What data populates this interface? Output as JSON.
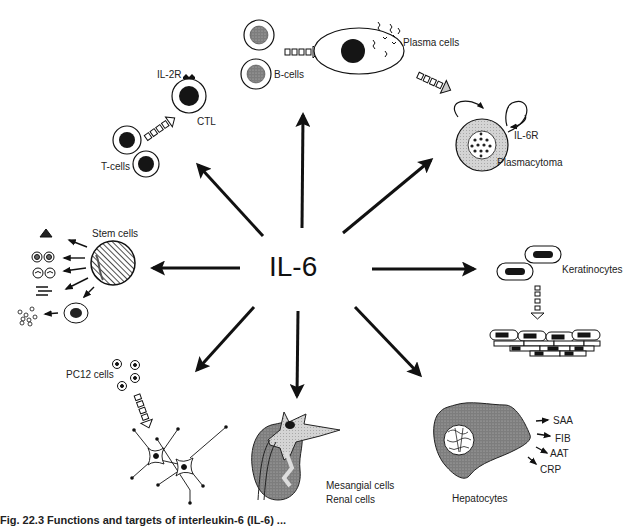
{
  "diagram": {
    "center": "IL-6",
    "targets": [
      {
        "id": "t-cells",
        "labels": {
          "cells": "T-cells",
          "activated": "CTL",
          "receptor": "IL-2R"
        }
      },
      {
        "id": "b-cells",
        "labels": {
          "cells": "B-cells",
          "activated": "Plasma cells"
        }
      },
      {
        "id": "plasmacytoma",
        "labels": {
          "cells": "Plasmacytoma",
          "receptor": "IL-6R"
        }
      },
      {
        "id": "stem-cells",
        "labels": {
          "cells": "Stem cells"
        }
      },
      {
        "id": "keratinocytes",
        "labels": {
          "cells": "Keratinocytes"
        }
      },
      {
        "id": "pc12-cells",
        "labels": {
          "cells": "PC12 cells"
        }
      },
      {
        "id": "renal",
        "labels": {
          "line1": "Mesangial cells",
          "line2": "Renal cells"
        }
      },
      {
        "id": "hepatocytes",
        "labels": {
          "cells": "Hepatocytes",
          "products": [
            "SAA",
            "FIB",
            "AAT",
            "CRP"
          ]
        }
      }
    ],
    "caption_partial": "Fig. 22.3   Functions and targets of interleukin-6 (IL-6) ..."
  },
  "colors": {
    "ink": "#111111",
    "shade": "#8a8a8a",
    "light_shade": "#cfcfcf",
    "background": "#ffffff"
  }
}
